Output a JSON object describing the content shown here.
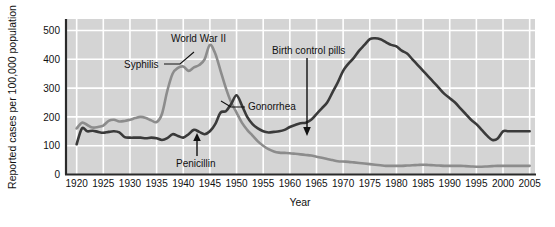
{
  "chart_data": {
    "type": "line",
    "title": "",
    "xlabel": "Year",
    "ylabel": "Reported cases per 100,000 population",
    "xlim": [
      1918,
      2006
    ],
    "ylim": [
      0,
      540
    ],
    "yticks": [
      "0",
      "100",
      "200",
      "300",
      "400",
      "500"
    ],
    "ytick_values": [
      0,
      100,
      200,
      300,
      400,
      500
    ],
    "xticks": [
      "1920",
      "1925",
      "1930",
      "1935",
      "1940",
      "1945",
      "1950",
      "1955",
      "1960",
      "1965",
      "1970",
      "1975",
      "1980",
      "1985",
      "1990",
      "1995",
      "2000",
      "2005"
    ],
    "xtick_values": [
      1920,
      1925,
      1930,
      1935,
      1940,
      1945,
      1950,
      1955,
      1960,
      1965,
      1970,
      1975,
      1980,
      1985,
      1990,
      1995,
      2000,
      2005
    ],
    "grid": true,
    "grid_color": "#ffffff",
    "plot_background": "#d4d4d4",
    "legend": "inline-annotations",
    "series": [
      {
        "name": "Syphilis",
        "color": "#8c8c8c",
        "x": [
          1920,
          1921,
          1922,
          1923,
          1924,
          1925,
          1926,
          1927,
          1928,
          1929,
          1930,
          1931,
          1932,
          1933,
          1934,
          1935,
          1936,
          1937,
          1938,
          1939,
          1940,
          1941,
          1942,
          1943,
          1944,
          1945,
          1946,
          1947,
          1948,
          1949,
          1950,
          1951,
          1952,
          1953,
          1954,
          1955,
          1956,
          1957,
          1958,
          1959,
          1960,
          1961,
          1962,
          1963,
          1964,
          1965,
          1966,
          1967,
          1968,
          1969,
          1970,
          1971,
          1972,
          1973,
          1974,
          1975,
          1976,
          1977,
          1978,
          1979,
          1980,
          1981,
          1982,
          1983,
          1984,
          1985,
          1986,
          1987,
          1988,
          1989,
          1990,
          1991,
          1992,
          1993,
          1994,
          1995,
          1996,
          1997,
          1998,
          1999,
          2000,
          2001,
          2002,
          2003,
          2004,
          2005
        ],
        "values": [
          160,
          180,
          172,
          163,
          165,
          170,
          186,
          190,
          184,
          186,
          190,
          196,
          200,
          196,
          188,
          182,
          210,
          290,
          350,
          370,
          375,
          360,
          372,
          380,
          400,
          450,
          420,
          360,
          300,
          250,
          215,
          180,
          155,
          135,
          115,
          100,
          88,
          80,
          76,
          75,
          74,
          72,
          70,
          68,
          66,
          62,
          58,
          54,
          50,
          46,
          45,
          44,
          42,
          40,
          38,
          36,
          34,
          32,
          30,
          30,
          30,
          30,
          31,
          32,
          33,
          34,
          33,
          32,
          31,
          30,
          30,
          30,
          30,
          29,
          28,
          27,
          27,
          28,
          29,
          30,
          30,
          30,
          30,
          30,
          30,
          30
        ]
      },
      {
        "name": "Gonorrhea",
        "color": "#3a3a3a",
        "x": [
          1920,
          1921,
          1922,
          1923,
          1924,
          1925,
          1926,
          1927,
          1928,
          1929,
          1930,
          1931,
          1932,
          1933,
          1934,
          1935,
          1936,
          1937,
          1938,
          1939,
          1940,
          1941,
          1942,
          1943,
          1944,
          1945,
          1946,
          1947,
          1948,
          1949,
          1950,
          1951,
          1952,
          1953,
          1954,
          1955,
          1956,
          1957,
          1958,
          1959,
          1960,
          1961,
          1962,
          1963,
          1964,
          1965,
          1966,
          1967,
          1968,
          1969,
          1970,
          1971,
          1972,
          1973,
          1974,
          1975,
          1976,
          1977,
          1978,
          1979,
          1980,
          1981,
          1982,
          1983,
          1984,
          1985,
          1986,
          1987,
          1988,
          1989,
          1990,
          1991,
          1992,
          1993,
          1994,
          1995,
          1996,
          1997,
          1998,
          1999,
          2000,
          2001,
          2002,
          2003,
          2004,
          2005
        ],
        "values": [
          105,
          160,
          150,
          152,
          148,
          145,
          148,
          150,
          146,
          130,
          128,
          128,
          128,
          126,
          128,
          126,
          120,
          126,
          140,
          134,
          128,
          140,
          155,
          148,
          140,
          150,
          175,
          215,
          220,
          245,
          275,
          240,
          200,
          175,
          160,
          150,
          146,
          148,
          150,
          155,
          165,
          172,
          178,
          180,
          190,
          210,
          230,
          250,
          285,
          320,
          360,
          385,
          405,
          430,
          450,
          470,
          473,
          470,
          460,
          450,
          445,
          430,
          420,
          400,
          380,
          360,
          340,
          320,
          300,
          280,
          265,
          250,
          230,
          210,
          190,
          175,
          155,
          135,
          120,
          125,
          150,
          150,
          150,
          150,
          150,
          150
        ]
      }
    ],
    "annotations": [
      {
        "name": "syphilis-label",
        "text": "Syphilis",
        "kind": "leader-line"
      },
      {
        "name": "world-war-2-label",
        "text": "World War II",
        "kind": "text"
      },
      {
        "name": "gonorrhea-label",
        "text": "Gonorrhea",
        "kind": "leader-line"
      },
      {
        "name": "penicillin-label",
        "text": "Penicillin",
        "kind": "up-arrow"
      },
      {
        "name": "birth-control-pills-label",
        "text": "Birth control pills",
        "kind": "down-arrow"
      }
    ]
  }
}
